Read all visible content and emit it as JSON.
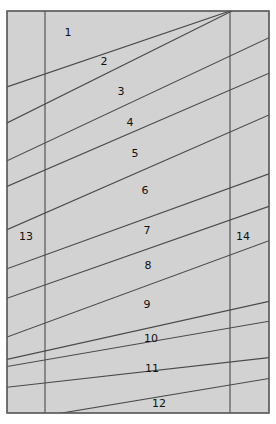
{
  "figure": {
    "type": "diagram",
    "canvas": {
      "width": 276,
      "height": 424
    },
    "colors": {
      "background": "#ffffff",
      "fill": "#d2d2d2",
      "border": "#5a5a5a",
      "line": "#4a4a4a",
      "label": "#111111"
    },
    "outer_frame": {
      "x": 7,
      "y": 11,
      "width": 262,
      "height": 402
    },
    "vertical_lines": [
      {
        "name": "left-boundary",
        "x": 45,
        "y1": 11,
        "y2": 413
      },
      {
        "name": "right-boundary",
        "x": 230,
        "y1": 11,
        "y2": 413
      }
    ],
    "diagonal_lines": [
      {
        "id": "d1",
        "x1": 45,
        "y1": 74,
        "x2": 230,
        "y2": 11
      },
      {
        "id": "d2",
        "x1": 45,
        "y1": 104,
        "x2": 230,
        "y2": 12
      },
      {
        "id": "d3",
        "x1": 45,
        "y1": 143,
        "x2": 230,
        "y2": 56
      },
      {
        "id": "d4",
        "x1": 45,
        "y1": 170,
        "x2": 230,
        "y2": 90
      },
      {
        "id": "d5",
        "x1": 45,
        "y1": 213,
        "x2": 230,
        "y2": 132
      },
      {
        "id": "d6",
        "x1": 45,
        "y1": 255,
        "x2": 230,
        "y2": 188
      },
      {
        "id": "d7",
        "x1": 45,
        "y1": 285,
        "x2": 230,
        "y2": 220
      },
      {
        "id": "d8",
        "x1": 45,
        "y1": 323,
        "x2": 230,
        "y2": 255
      },
      {
        "id": "d9",
        "x1": 45,
        "y1": 351,
        "x2": 230,
        "y2": 310
      },
      {
        "id": "d10",
        "x1": 45,
        "y1": 360,
        "x2": 230,
        "y2": 328
      },
      {
        "id": "d11",
        "x1": 45,
        "y1": 383,
        "x2": 230,
        "y2": 362
      },
      {
        "id": "d12",
        "x1": 62,
        "y1": 413,
        "x2": 230,
        "y2": 385
      }
    ],
    "labels": [
      {
        "text": "1",
        "x": 68,
        "y": 32,
        "region": "layer-1"
      },
      {
        "text": "2",
        "x": 104,
        "y": 61,
        "region": "layer-2"
      },
      {
        "text": "3",
        "x": 121,
        "y": 91,
        "region": "layer-3"
      },
      {
        "text": "4",
        "x": 130,
        "y": 122,
        "region": "layer-4"
      },
      {
        "text": "5",
        "x": 135,
        "y": 153,
        "region": "layer-5"
      },
      {
        "text": "6",
        "x": 145,
        "y": 190,
        "region": "layer-6"
      },
      {
        "text": "7",
        "x": 147,
        "y": 230,
        "region": "layer-7"
      },
      {
        "text": "8",
        "x": 148,
        "y": 265,
        "region": "layer-8"
      },
      {
        "text": "9",
        "x": 147,
        "y": 304,
        "region": "layer-9"
      },
      {
        "text": "10",
        "x": 151,
        "y": 338,
        "region": "layer-10"
      },
      {
        "text": "11",
        "x": 152,
        "y": 368,
        "region": "layer-11"
      },
      {
        "text": "12",
        "x": 159,
        "y": 403,
        "region": "layer-12"
      },
      {
        "text": "13",
        "x": 26,
        "y": 236,
        "region": "left-column"
      },
      {
        "text": "14",
        "x": 243,
        "y": 236,
        "region": "right-column"
      }
    ]
  }
}
